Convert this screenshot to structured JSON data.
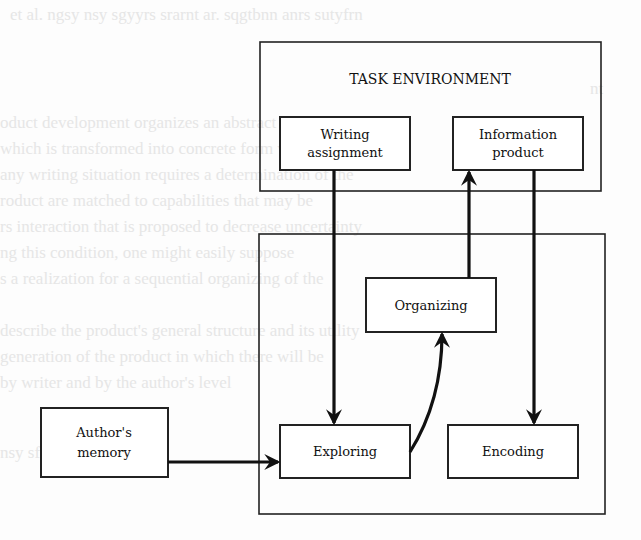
{
  "diagram": {
    "task_environment": {
      "title": "TASK ENVIRONMENT"
    },
    "nodes": {
      "writing_assignment": {
        "line1": "Writing",
        "line2": "assignment"
      },
      "information_product": {
        "line1": "Information",
        "line2": "product"
      },
      "organizing": {
        "label": "Organizing"
      },
      "exploring": {
        "label": "Exploring"
      },
      "encoding": {
        "label": "Encoding"
      },
      "authors_memory": {
        "line1": "Author's",
        "line2": "memory"
      }
    },
    "edges": [
      {
        "from": "Writing assignment",
        "to": "Exploring"
      },
      {
        "from": "Organizing",
        "to": "Information product"
      },
      {
        "from": "Information product",
        "to": "Encoding"
      },
      {
        "from": "Exploring",
        "to": "Organizing"
      },
      {
        "from": "Author's memory",
        "to": "Exploring"
      }
    ]
  }
}
